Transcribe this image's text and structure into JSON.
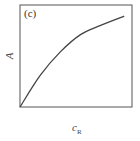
{
  "chart_data": {
    "type": "line",
    "title": "",
    "panel_label": "(c)",
    "xlabel": "c_R",
    "xlabel_main": "c",
    "xlabel_sub": "R",
    "ylabel": "A",
    "grid": false,
    "legend": null,
    "x_ticks": [],
    "y_ticks": [],
    "series": [
      {
        "name": "A vs c_R",
        "x": [
          0.0,
          0.18,
          0.36,
          0.54,
          0.72,
          0.93
        ],
        "y": [
          0.0,
          0.31,
          0.54,
          0.71,
          0.8,
          0.89
        ]
      }
    ],
    "xlim": [
      0,
      1
    ],
    "ylim": [
      0,
      1
    ]
  }
}
